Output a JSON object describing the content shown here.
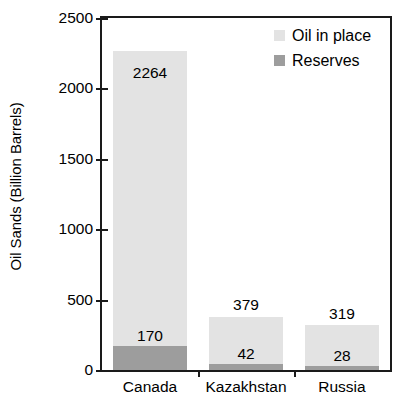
{
  "chart_data": {
    "type": "bar",
    "subtype": "stacked-bar",
    "title": "",
    "xlabel": "",
    "ylabel": "Oil Sands (Billion Barrels)",
    "ylim": [
      0,
      2500
    ],
    "ytick_labels": [
      "0",
      "500",
      "1000",
      "1500",
      "2000",
      "2500"
    ],
    "ytick_values": [
      0,
      500,
      1000,
      1500,
      2000,
      2500
    ],
    "grid": false,
    "legend_position": "top-right-inside",
    "categories": [
      "Canada",
      "Kazakhstan",
      "Russia"
    ],
    "series": [
      {
        "name": "Oil in place",
        "color": "#e3e3e3",
        "values": [
          2264,
          379,
          319
        ],
        "value_labels": [
          "2264",
          "379",
          "319"
        ]
      },
      {
        "name": "Reserves",
        "color": "#9d9d9d",
        "values": [
          170,
          42,
          28
        ],
        "value_labels": [
          "170",
          "42",
          "28"
        ]
      }
    ]
  },
  "legend": {
    "items": [
      {
        "label": "Oil in place",
        "color": "#e3e3e3"
      },
      {
        "label": "Reserves",
        "color": "#9d9d9d"
      }
    ]
  },
  "axis": {
    "y_title": "Oil Sands (Billion Barrels)"
  },
  "colors": {
    "oil_in_place": "#e3e3e3",
    "reserves": "#9d9d9d",
    "axis": "#1a1a1a",
    "background": "#ffffff",
    "text": "#000000"
  }
}
